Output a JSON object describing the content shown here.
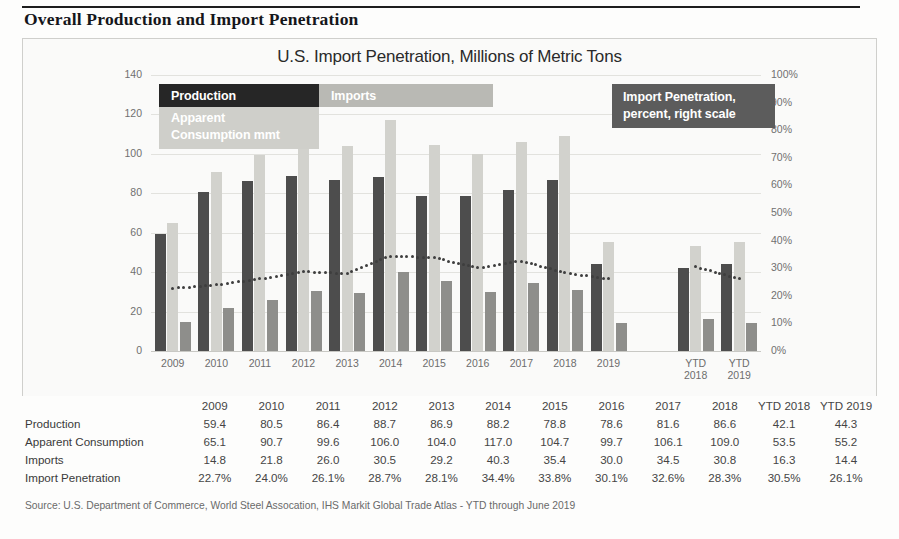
{
  "page_title": "Overall Production and Import Penetration",
  "chart_title": "U.S. Import Penetration, Millions of Metric Tons",
  "legend": {
    "production": "Production",
    "imports": "Imports",
    "consumption": "Apparent\nConsumption mmt",
    "penetration": "Import Penetration,\npercent, right scale"
  },
  "colors": {
    "production": "#4d4d4d",
    "consumption": "#d2d2cd",
    "imports": "#8e8e8b",
    "penetration_line": "#3e3e3e",
    "legend_production": "#262626",
    "legend_imports": "#b9b9b4",
    "legend_consumption": "#cfcfca",
    "legend_penetration": "#5c5c5c",
    "grid": "#e2e2de",
    "card_bg": "#fafaf9"
  },
  "chart_data": {
    "type": "bar",
    "title": "U.S. Import Penetration, Millions of Metric Tons",
    "xlabel": "",
    "ylabel": "",
    "ylim": [
      0,
      140
    ],
    "yticks": [
      0,
      20,
      40,
      60,
      80,
      100,
      120,
      140
    ],
    "y2lim": [
      0,
      100
    ],
    "y2ticks": [
      "0%",
      "10%",
      "20%",
      "30%",
      "40%",
      "50%",
      "60%",
      "70%",
      "80%",
      "90%",
      "100%"
    ],
    "y2label": "percent",
    "grid": true,
    "legend_position": "inside-top",
    "categories": [
      "2009",
      "2010",
      "2011",
      "2012",
      "2013",
      "2014",
      "2015",
      "2016",
      "2017",
      "2018",
      "2019",
      "",
      "YTD\n2018",
      "YTD\n2019"
    ],
    "series": [
      {
        "name": "Production",
        "type": "bar",
        "values": [
          59.4,
          80.5,
          86.4,
          88.7,
          86.9,
          88.2,
          78.8,
          78.6,
          81.6,
          86.6,
          44.3,
          null,
          42.1,
          44.3
        ]
      },
      {
        "name": "Apparent Consumption mmt",
        "type": "bar",
        "values": [
          65.1,
          90.7,
          99.6,
          106.0,
          104.0,
          117.0,
          104.7,
          99.7,
          106.1,
          109.0,
          55.2,
          null,
          53.5,
          55.2
        ]
      },
      {
        "name": "Imports",
        "type": "bar",
        "values": [
          14.8,
          21.8,
          26.0,
          30.5,
          29.2,
          40.3,
          35.4,
          30.0,
          34.5,
          30.8,
          14.4,
          null,
          16.3,
          14.4
        ]
      },
      {
        "name": "Import Penetration, percent, right scale",
        "type": "line-dotted",
        "axis": "right",
        "values": [
          22.7,
          24.0,
          26.1,
          28.7,
          28.1,
          34.4,
          33.8,
          30.1,
          32.6,
          28.3,
          26.1,
          null,
          30.5,
          26.1
        ]
      }
    ]
  },
  "table": {
    "columns": [
      "",
      "2009",
      "2010",
      "2011",
      "2012",
      "2013",
      "2014",
      "2015",
      "2016",
      "2017",
      "2018",
      "YTD 2018",
      "YTD 2019"
    ],
    "rows": [
      {
        "label": "Production",
        "values": [
          "59.4",
          "80.5",
          "86.4",
          "88.7",
          "86.9",
          "88.2",
          "78.8",
          "78.6",
          "81.6",
          "86.6",
          "42.1",
          "44.3"
        ]
      },
      {
        "label": "Apparent Consumption",
        "values": [
          "65.1",
          "90.7",
          "99.6",
          "106.0",
          "104.0",
          "117.0",
          "104.7",
          "99.7",
          "106.1",
          "109.0",
          "53.5",
          "55.2"
        ]
      },
      {
        "label": "Imports",
        "values": [
          "14.8",
          "21.8",
          "26.0",
          "30.5",
          "29.2",
          "40.3",
          "35.4",
          "30.0",
          "34.5",
          "30.8",
          "16.3",
          "14.4"
        ]
      },
      {
        "label": "Import Penetration",
        "values": [
          "22.7%",
          "24.0%",
          "26.1%",
          "28.7%",
          "28.1%",
          "34.4%",
          "33.8%",
          "30.1%",
          "32.6%",
          "28.3%",
          "30.5%",
          "26.1%"
        ]
      }
    ]
  },
  "source_note": "Source: U.S. Department of Commerce, World Steel Assocation, IHS Markit Global Trade Atlas -  YTD through June 2019"
}
